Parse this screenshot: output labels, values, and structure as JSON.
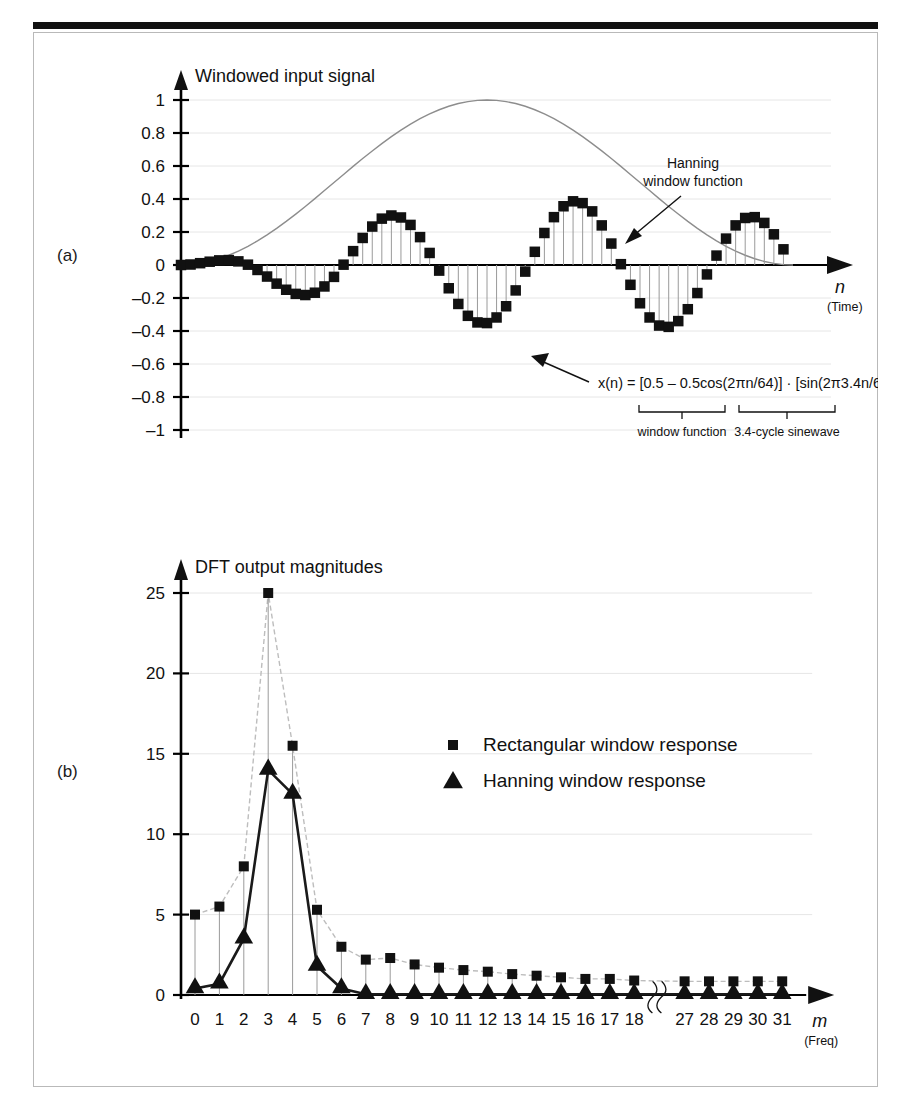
{
  "figure": {
    "panel_a_tag": "(a)",
    "panel_b_tag": "(b)"
  },
  "panel_a": {
    "title": "Windowed input signal",
    "xlabel": "n",
    "xlabel_sub": "(Time)",
    "annotation_window": "Hanning\nwindow function",
    "annotation_window_line1": "Hanning",
    "annotation_window_line2": "window function",
    "equation": "x(n) = [0.5 – 0.5cos(2πn/64)] · [sin(2π3.4n/64)]",
    "brace_label_left": "window function",
    "brace_label_right": "3.4-cycle sinewave",
    "yticks": [
      "1",
      "0.8",
      "0.6",
      "0.4",
      "0.2",
      "0",
      "–0.2",
      "–0.4",
      "–0.6",
      "–0.8",
      "–1"
    ]
  },
  "panel_b": {
    "title": "DFT output magnitudes",
    "xlabel": "m",
    "xlabel_sub": "(Freq)",
    "yticks": [
      "25",
      "20",
      "15",
      "10",
      "5",
      "0"
    ],
    "legend": [
      {
        "marker": "square",
        "label": "Rectangular window response"
      },
      {
        "marker": "triangle",
        "label": "Hanning window response"
      }
    ]
  },
  "chart_data": [
    {
      "type": "line",
      "id": "windowed-input-signal",
      "title": "Windowed input signal",
      "xlabel": "n (Time)",
      "ylabel": "",
      "ylim": [
        -1,
        1
      ],
      "xlim": [
        0,
        64
      ],
      "grid": true,
      "series": [
        {
          "name": "x(n) windowed samples",
          "marker": "square",
          "x": [
            0,
            1,
            2,
            3,
            4,
            5,
            6,
            7,
            8,
            9,
            10,
            11,
            12,
            13,
            14,
            15,
            16,
            17,
            18,
            19,
            20,
            21,
            22,
            23,
            24,
            25,
            26,
            27,
            28,
            29,
            30,
            31,
            32,
            33,
            34,
            35,
            36,
            37,
            38,
            39,
            40,
            41,
            42,
            43,
            44,
            45,
            46,
            47,
            48,
            49,
            50,
            51,
            52,
            53,
            54,
            55,
            56,
            57,
            58,
            59,
            60,
            61,
            62,
            63
          ],
          "y": [
            0,
            0.003,
            0.011,
            0.02,
            0.028,
            0.03,
            0.022,
            0.002,
            -0.03,
            -0.07,
            -0.113,
            -0.15,
            -0.175,
            -0.182,
            -0.168,
            -0.13,
            -0.072,
            0.002,
            0.084,
            0.164,
            0.233,
            0.281,
            0.3,
            0.288,
            0.243,
            0.169,
            0.073,
            -0.034,
            -0.141,
            -0.236,
            -0.308,
            -0.348,
            -0.352,
            -0.318,
            -0.25,
            -0.154,
            -0.04,
            0.08,
            0.194,
            0.29,
            0.356,
            0.386,
            0.375,
            0.325,
            0.24,
            0.13,
            0.005,
            -0.12,
            -0.232,
            -0.318,
            -0.367,
            -0.375,
            -0.34,
            -0.268,
            -0.17,
            -0.057,
            0.057,
            0.16,
            0.24,
            0.285,
            0.29,
            0.255,
            0.186,
            0.095
          ]
        },
        {
          "name": "Hanning window function",
          "marker": "none",
          "x": [
            0,
            4,
            8,
            12,
            16,
            20,
            24,
            28,
            32,
            36,
            40,
            44,
            48,
            52,
            56,
            60,
            64
          ],
          "y": [
            0,
            0.038,
            0.146,
            0.309,
            0.5,
            0.691,
            0.854,
            0.962,
            1,
            0.962,
            0.854,
            0.691,
            0.5,
            0.309,
            0.146,
            0.038,
            0
          ]
        }
      ]
    },
    {
      "type": "line",
      "id": "dft-output-magnitudes",
      "title": "DFT output magnitudes",
      "xlabel": "m (Freq)",
      "ylabel": "",
      "ylim": [
        0,
        25
      ],
      "grid": true,
      "axis_break_after": 18,
      "categories": [
        "0",
        "1",
        "2",
        "3",
        "4",
        "5",
        "6",
        "7",
        "8",
        "9",
        "10",
        "11",
        "12",
        "13",
        "14",
        "15",
        "16",
        "17",
        "18",
        "27",
        "28",
        "29",
        "30",
        "31"
      ],
      "series": [
        {
          "name": "Rectangular window response",
          "marker": "square",
          "values": [
            5.0,
            5.5,
            8.0,
            25.0,
            15.5,
            5.3,
            3.0,
            2.2,
            2.3,
            1.9,
            1.7,
            1.55,
            1.45,
            1.3,
            1.2,
            1.1,
            1.0,
            1.0,
            0.9,
            0.85,
            0.85,
            0.85,
            0.85,
            0.85
          ]
        },
        {
          "name": "Hanning window response",
          "marker": "triangle",
          "values": [
            0.4,
            0.7,
            3.5,
            14.0,
            12.5,
            1.8,
            0.4,
            0.05,
            0.05,
            0.05,
            0.05,
            0.05,
            0.05,
            0.05,
            0.05,
            0.05,
            0.05,
            0.05,
            0.05,
            0.05,
            0.05,
            0.05,
            0.05,
            0.05
          ]
        }
      ]
    }
  ]
}
